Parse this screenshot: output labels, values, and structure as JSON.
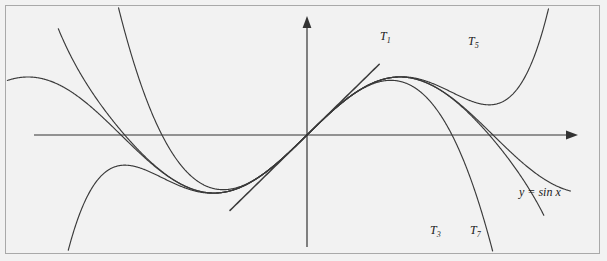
{
  "figure": {
    "background_color": "#f2f2f2",
    "border_color": "#a9a9a9",
    "curve_color": "#3a3a3a",
    "axis_color": "#333333"
  },
  "axes": {
    "x_label": "x",
    "y_label": "y",
    "origin_px": [
      307,
      135
    ],
    "x_axis_y_px": 135,
    "y_axis_x_px": 307,
    "x_units_per_px": 0.01689,
    "y_px_per_unit": 58
  },
  "labels": {
    "t1": "T",
    "t1_sub": "1",
    "t3": "T",
    "t3_sub": "3",
    "t5": "T",
    "t5_sub": "5",
    "t7": "T",
    "t7_sub": "7",
    "function": "y = sin x"
  },
  "chart_data": {
    "type": "line",
    "title": "",
    "xlabel": "x",
    "ylabel": "y",
    "xlim": [
      -5.2,
      4.45
    ],
    "ylim": [
      -2.1,
      2.1
    ],
    "grid": false,
    "legend": "inline-annotations",
    "series": [
      {
        "name": "y = sin x",
        "expression": "sin(x)",
        "annotation": "y = sin x",
        "annotation_xy": [
          3.6,
          -1.25
        ]
      },
      {
        "name": "T1",
        "expression": "x",
        "annotation": "T_1",
        "annotation_xy": [
          1.29,
          1.73
        ]
      },
      {
        "name": "T3",
        "expression": "x - x^3/6",
        "annotation": "T_3",
        "annotation_xy": [
          2.03,
          -1.68
        ]
      },
      {
        "name": "T5",
        "expression": "x - x^3/6 + x^5/120",
        "annotation": "T_5",
        "annotation_xy": [
          2.81,
          1.66
        ]
      },
      {
        "name": "T7",
        "expression": "x - x^3/6 + x^5/120 - x^7/5040",
        "annotation": "T_7",
        "annotation_xy": [
          2.52,
          -1.73
        ]
      }
    ]
  }
}
